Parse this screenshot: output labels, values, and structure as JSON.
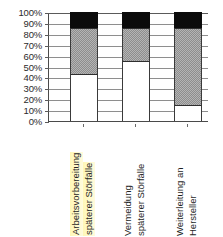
{
  "chart_data": {
    "type": "bar",
    "subtype": "100% stacked column",
    "title": "",
    "subtitle": "",
    "xlabel": "",
    "ylabel": "",
    "ylim": [
      0,
      100
    ],
    "grid": true,
    "legend_position": "none",
    "categories": [
      "Arbeitsvorbereitung späterer Störfälle",
      "Vermeidung späterer Störfälle",
      "Weiterleitung an Hersteller"
    ],
    "category_lines": [
      [
        "Arbeitsvorbereitung",
        "späterer Störfälle"
      ],
      [
        "Vermeidung",
        "späterer Störfälle"
      ],
      [
        "Weiterleitung an",
        "Hersteller"
      ]
    ],
    "highlighted_category_index": 0,
    "highlight_color": "#fff6aa",
    "y_tick_labels": [
      "100%",
      "90%",
      "80%",
      "70%",
      "60%",
      "50%",
      "40%",
      "30%",
      "20%",
      "10%",
      "0%"
    ],
    "y_tick_values": [
      100,
      90,
      80,
      70,
      60,
      50,
      40,
      30,
      20,
      10,
      0
    ],
    "series": [
      {
        "name": "white-segment",
        "color": "#ffffff",
        "fill": "solid-white",
        "values": [
          43,
          55,
          15
        ]
      },
      {
        "name": "gray-segment",
        "color": "#b4b4b4",
        "fill": "dotted-gray",
        "values": [
          42,
          30,
          70
        ]
      },
      {
        "name": "black-segment",
        "color": "#0b0b0b",
        "fill": "solid-black",
        "values": [
          15,
          15,
          15
        ]
      }
    ]
  },
  "axis": {
    "line_color": "#4a4a4a",
    "gridline_color": "#8e8e8e"
  }
}
